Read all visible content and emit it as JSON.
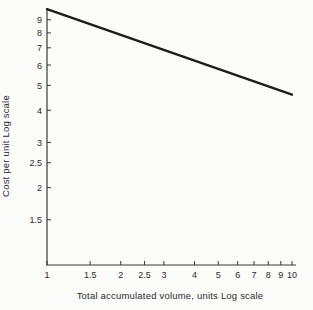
{
  "figure": {
    "background": "#fbfbfa",
    "ink": "#2b2b2b",
    "axis_color": "#3a3a3a",
    "line_color": "#1c1c1c"
  },
  "chart_data": {
    "type": "line",
    "title": "",
    "xlabel": "Total accumulated volume, units Log scale",
    "ylabel": "Cost per unit Log scale",
    "x_scale": "log",
    "y_scale": "log",
    "xlim": [
      1,
      10
    ],
    "ylim": [
      1,
      10
    ],
    "grid": false,
    "legend": false,
    "x_ticks": [
      {
        "value": 1,
        "label": "1"
      },
      {
        "value": 1.5,
        "label": "1.5"
      },
      {
        "value": 2,
        "label": "2"
      },
      {
        "value": 2.5,
        "label": "2.5"
      },
      {
        "value": 3,
        "label": "3"
      },
      {
        "value": 4,
        "label": "4"
      },
      {
        "value": 5,
        "label": "5"
      },
      {
        "value": 6,
        "label": "6"
      },
      {
        "value": 7,
        "label": "7"
      },
      {
        "value": 8,
        "label": "8"
      },
      {
        "value": 9,
        "label": "9"
      },
      {
        "value": 10,
        "label": "10"
      }
    ],
    "y_ticks": [
      {
        "value": 1.5,
        "label": "1.5"
      },
      {
        "value": 2,
        "label": "2"
      },
      {
        "value": 2.5,
        "label": "2.5"
      },
      {
        "value": 3,
        "label": "3"
      },
      {
        "value": 4,
        "label": "4"
      },
      {
        "value": 5,
        "label": "5"
      },
      {
        "value": 6,
        "label": "6"
      },
      {
        "value": 7,
        "label": "7"
      },
      {
        "value": 8,
        "label": "8"
      },
      {
        "value": 9,
        "label": "9"
      }
    ],
    "series": [
      {
        "points": [
          [
            1,
            9.9
          ],
          [
            10,
            4.6
          ]
        ],
        "stroke_width": 2.3
      }
    ]
  }
}
